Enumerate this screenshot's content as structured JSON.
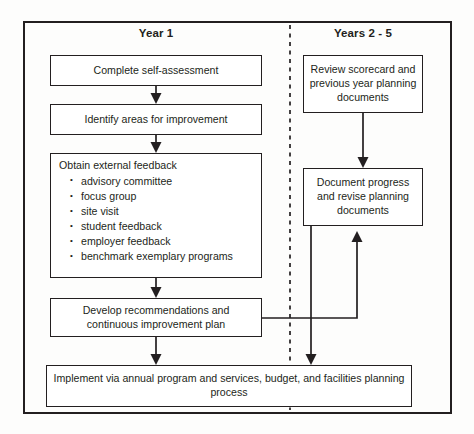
{
  "diagram": {
    "columns": [
      {
        "id": "year1",
        "label": "Year 1"
      },
      {
        "id": "years25",
        "label": "Years 2 - 5"
      }
    ],
    "nodes": {
      "complete_self_assessment": {
        "label": "Complete self-assessment"
      },
      "identify_areas": {
        "label": "Identify areas for improvement"
      },
      "obtain_feedback": {
        "title": "Obtain external feedback",
        "bullets": [
          "advisory committee",
          "focus group",
          "site visit",
          "student feedback",
          "employer feedback",
          "benchmark exemplary programs"
        ]
      },
      "develop_recommendations": {
        "label": "Develop recommendations and continuous improvement plan"
      },
      "implement": {
        "label": "Implement via annual program and services, budget, and facilities planning process"
      },
      "review_scorecard": {
        "label": "Review scorecard and previous year planning documents"
      },
      "document_progress": {
        "label": "Document progress and revise planning documents"
      }
    },
    "colors": {
      "ink": "#231f20",
      "background": "#fdfdfc",
      "node_fill": "#ffffff"
    }
  }
}
